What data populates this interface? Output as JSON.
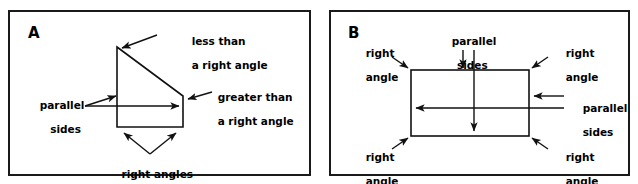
{
  "figure": {
    "width": 638,
    "height": 184,
    "background": "#ffffff",
    "stroke_color": "#1a1a1a"
  },
  "panels": [
    {
      "id": "A",
      "letter": "A",
      "shape": {
        "type": "trapezoid",
        "vertices": [
          [
            117,
            47
          ],
          [
            183,
            96
          ],
          [
            183,
            127
          ],
          [
            117,
            127
          ]
        ],
        "description": "right trapezoid with vertical left side, horizontal bottom side, slanted top side"
      },
      "annotations": [
        {
          "name": "less-than-right-angle",
          "line1": "less than",
          "line2": "a right angle",
          "points_to": "top-left vertex"
        },
        {
          "name": "greater-than-right-angle",
          "line1": "greater than",
          "line2": "a right angle",
          "points_to": "right vertex"
        },
        {
          "name": "parallel-sides",
          "line1": "parallel",
          "line2": "sides",
          "points_to": "left vertical side and slanted side"
        },
        {
          "name": "right-angles",
          "line1": "right angles",
          "line2": "",
          "points_to": "bottom-left and bottom-right vertices"
        }
      ]
    },
    {
      "id": "B",
      "letter": "B",
      "shape": {
        "type": "rectangle",
        "vertices": [
          [
            411,
            70
          ],
          [
            529,
            70
          ],
          [
            529,
            136
          ],
          [
            411,
            136
          ]
        ],
        "description": "rectangle with four right angles and two pairs of parallel sides"
      },
      "annotations": [
        {
          "name": "parallel-sides-top",
          "line1": "parallel",
          "line2": "sides",
          "points_to": "top side and bottom side"
        },
        {
          "name": "parallel-sides-right",
          "line1": "parallel",
          "line2": "sides",
          "points_to": "right side and left side"
        },
        {
          "name": "right-angle-top-left",
          "line1": "right",
          "line2": "angle",
          "points_to": "top-left corner"
        },
        {
          "name": "right-angle-top-right",
          "line1": "right",
          "line2": "angle",
          "points_to": "top-right corner"
        },
        {
          "name": "right-angle-bottom-left",
          "line1": "right",
          "line2": "angle",
          "points_to": "bottom-left corner"
        },
        {
          "name": "right-angle-bottom-right",
          "line1": "right",
          "line2": "angle",
          "points_to": "bottom-right corner"
        }
      ]
    }
  ]
}
